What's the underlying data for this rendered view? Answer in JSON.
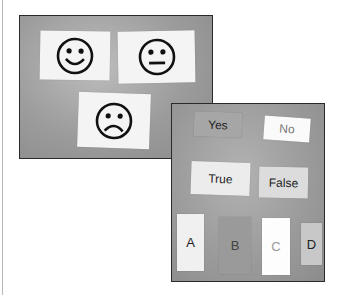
{
  "photo_emoticons": {
    "faces": [
      {
        "name": "happy",
        "mouth": "smile"
      },
      {
        "name": "neutral",
        "mouth": "flat"
      },
      {
        "name": "sad",
        "mouth": "frown"
      }
    ]
  },
  "photo_answer_cards": {
    "cards": [
      {
        "label": "Yes"
      },
      {
        "label": "No"
      },
      {
        "label": "True"
      },
      {
        "label": "False"
      },
      {
        "label": "A"
      },
      {
        "label": "B"
      },
      {
        "label": "C"
      },
      {
        "label": "D"
      }
    ]
  },
  "colors": {
    "card": "#f4f4f4",
    "board": "#9c9c9c",
    "frame": "#2a2a2a"
  }
}
